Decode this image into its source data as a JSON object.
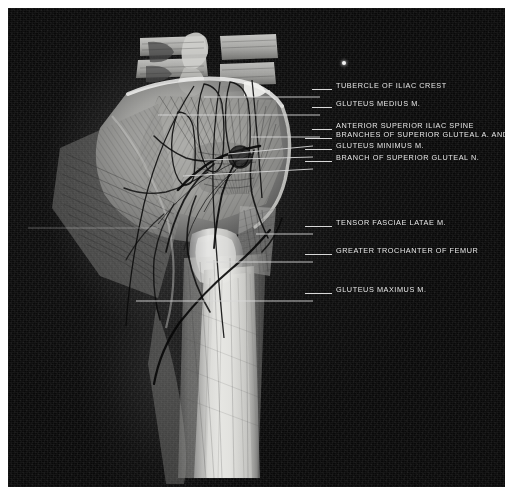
{
  "plate": {
    "kind": "radiograph-anatomical-plate",
    "region": "hip-and-gluteal-region",
    "background_color": "#090909",
    "frame_color": "#ffffff",
    "label_color": "#e9e9e9",
    "leader_color": "#d8d8d8"
  },
  "labels": [
    {
      "id": "tubercle-of-iliac-crest",
      "text": "TUBERCLE OF ILIAC CREST",
      "text_x": 336,
      "text_y": 86,
      "leader_x": 312,
      "leader_y": 89,
      "leader_w": 20,
      "target_x": 248,
      "target_y": 90
    },
    {
      "id": "gluteus-medius",
      "text": "GLUTEUS MEDIUS M.",
      "text_x": 336,
      "text_y": 104,
      "leader_x": 312,
      "leader_y": 107,
      "leader_w": 20,
      "target_x": 195,
      "target_y": 119
    },
    {
      "id": "anterior-superior-iliac-spine",
      "text": "ANTERIOR SUPERIOR ILIAC SPINE",
      "text_x": 336,
      "text_y": 126,
      "leader_x": 312,
      "leader_y": 129,
      "leader_w": 20,
      "target_x": 258,
      "target_y": 134
    },
    {
      "id": "branches-superior-gluteal-a-and-v",
      "text": "BRANCHES OF SUPERIOR GLUTEAL A. AND V.",
      "text_x": 336,
      "text_y": 135,
      "leader_x": 305,
      "leader_y": 138,
      "leader_w": 27,
      "target_x": 238,
      "target_y": 142
    },
    {
      "id": "gluteus-minimus",
      "text": "GLUTEUS MINIMUS M.",
      "text_x": 336,
      "text_y": 146,
      "leader_x": 305,
      "leader_y": 149,
      "leader_w": 27,
      "target_x": 232,
      "target_y": 152
    },
    {
      "id": "branch-superior-gluteal-n",
      "text": "BRANCH OF SUPERIOR GLUTEAL N.",
      "text_x": 336,
      "text_y": 158,
      "leader_x": 305,
      "leader_y": 161,
      "leader_w": 27,
      "target_x": 226,
      "target_y": 164
    },
    {
      "id": "tensor-fasciae-latae",
      "text": "TENSOR FASCIAE LATAE M.",
      "text_x": 336,
      "text_y": 223,
      "leader_x": 305,
      "leader_y": 226,
      "leader_w": 27,
      "target_x": 252,
      "target_y": 226
    },
    {
      "id": "greater-trochanter-of-femur",
      "text": "GREATER TROCHANTER OF FEMUR",
      "text_x": 336,
      "text_y": 251,
      "leader_x": 305,
      "leader_y": 254,
      "leader_w": 27,
      "target_x": 213,
      "target_y": 254
    },
    {
      "id": "gluteus-maximus",
      "text": "GLUTEUS MAXIMUS M.",
      "text_x": 336,
      "text_y": 290,
      "leader_x": 305,
      "leader_y": 293,
      "leader_w": 27,
      "target_x": 128,
      "target_y": 289
    }
  ],
  "artifacts": [
    {
      "id": "film-speck",
      "x": 334,
      "y": 53,
      "size": 4
    }
  ],
  "long_leaders": [
    {
      "id": "gluteus-medius-leader",
      "x1": 312,
      "y1": 89,
      "x2": 196,
      "y2": 89
    },
    {
      "id": "medius-body-leader",
      "x1": 312,
      "y1": 107,
      "x2": 150,
      "y2": 107
    },
    {
      "id": "asis-leader",
      "x1": 312,
      "y1": 129,
      "x2": 243,
      "y2": 129
    },
    {
      "id": "branches-leader",
      "x1": 305,
      "y1": 138,
      "x2": 220,
      "y2": 146
    },
    {
      "id": "minimus-leader",
      "x1": 305,
      "y1": 149,
      "x2": 196,
      "y2": 152
    },
    {
      "id": "branch-nerve-leader",
      "x1": 305,
      "y1": 161,
      "x2": 175,
      "y2": 168
    },
    {
      "id": "tfl-leader",
      "x1": 305,
      "y1": 226,
      "x2": 248,
      "y2": 226
    },
    {
      "id": "trochanter-leader",
      "x1": 305,
      "y1": 254,
      "x2": 198,
      "y2": 254
    },
    {
      "id": "maximus-leader",
      "x1": 305,
      "y1": 293,
      "x2": 128,
      "y2": 293
    },
    {
      "id": "faint-left-leader",
      "x1": 150,
      "y1": 220,
      "x2": 20,
      "y2": 220
    }
  ]
}
